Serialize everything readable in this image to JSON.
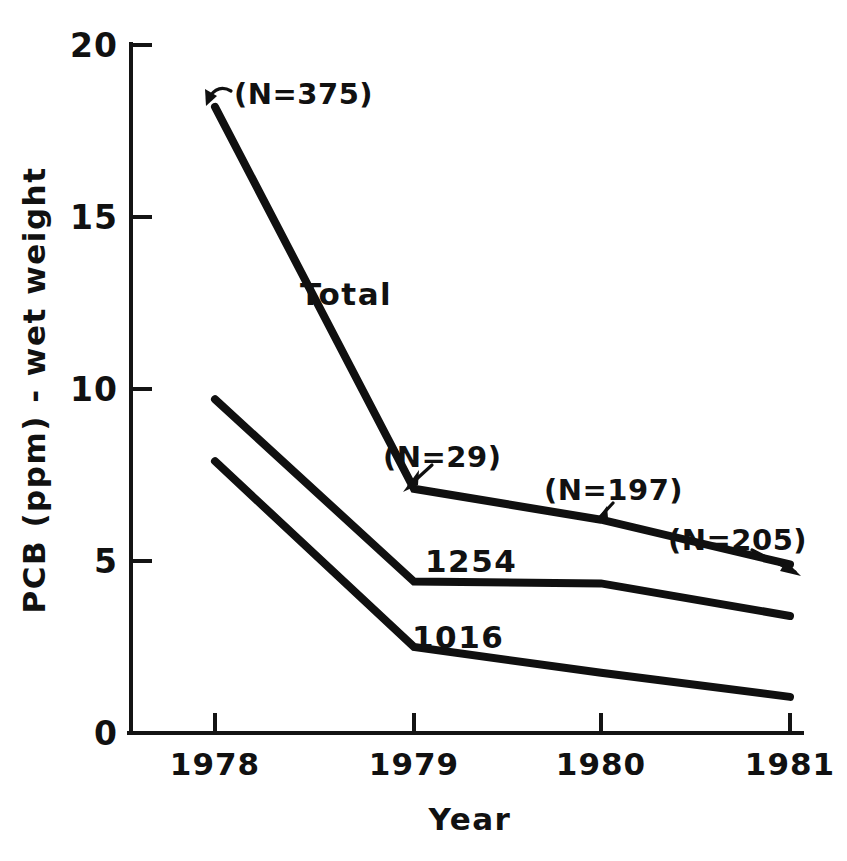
{
  "chart_data": {
    "type": "line",
    "title": "",
    "subtitle": "",
    "xlabel": "Year",
    "ylabel": "PCB (ppm) - wet weight",
    "categories": [
      "1978",
      "1979",
      "1980",
      "1981"
    ],
    "x": [
      1978,
      1979,
      1980,
      1981
    ],
    "xlim": [
      1977.55,
      1981.3
    ],
    "ylim": [
      0,
      20
    ],
    "y_ticks": [
      "0",
      "5",
      "10",
      "15",
      "20"
    ],
    "y_tick_values": [
      0,
      5,
      10,
      15,
      20
    ],
    "x_ticks": [
      "1978",
      "1979",
      "1980",
      "1981"
    ],
    "grid": false,
    "legend": "inline-labels",
    "series": [
      {
        "name": "Total",
        "label": "Total",
        "values": [
          18.2,
          7.1,
          6.2,
          4.9
        ],
        "color": "#101010"
      },
      {
        "name": "1254",
        "label": "1254",
        "values": [
          9.7,
          4.4,
          4.35,
          3.4
        ],
        "color": "#101010"
      },
      {
        "name": "1016",
        "label": "1016",
        "values": [
          7.9,
          2.5,
          1.75,
          1.05
        ],
        "color": "#101010"
      }
    ],
    "annotations": [
      {
        "text": "(N=375)",
        "points_to_series": "Total",
        "points_to_x": 1978,
        "points_to_y": 18.2
      },
      {
        "text": "(N=29)",
        "points_to_series": "Total",
        "points_to_x": 1979,
        "points_to_y": 7.1
      },
      {
        "text": "(N=197)",
        "points_to_series": "Total",
        "points_to_x": 1980,
        "points_to_y": 6.2
      },
      {
        "text": "(N=205)",
        "points_to_series": "Total",
        "points_to_x": 1981,
        "points_to_y": 4.9
      }
    ]
  },
  "axis": {
    "y_label": "PCB (ppm) - wet weight",
    "x_label": "Year",
    "y_tick_0": "0",
    "y_tick_1": "5",
    "y_tick_2": "10",
    "y_tick_3": "15",
    "y_tick_4": "20",
    "x_tick_0": "1978",
    "x_tick_1": "1979",
    "x_tick_2": "1980",
    "x_tick_3": "1981"
  },
  "series_labels": {
    "total": "Total",
    "a1254": "1254",
    "a1016": "1016"
  },
  "annotations": {
    "n375": "(N=375)",
    "n29": "(N=29)",
    "n197": "(N=197)",
    "n205": "(N=205)"
  },
  "colors": {
    "ink": "#101010",
    "background": "#ffffff"
  }
}
